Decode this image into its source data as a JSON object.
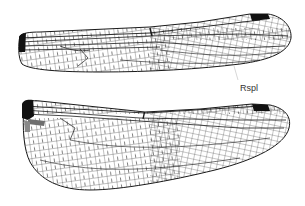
{
  "figure": {
    "labels": [
      {
        "id": "rspl",
        "text": "Rspl",
        "x": 240,
        "y": 82
      }
    ],
    "colors": {
      "vein": "#1a1a1a",
      "pterostigma": "#111111",
      "basal_patch": "#6e6e6e",
      "membrane": "#ffffff"
    },
    "wings": [
      {
        "name": "forewing",
        "position": "top"
      },
      {
        "name": "hindwing",
        "position": "bottom"
      }
    ]
  }
}
